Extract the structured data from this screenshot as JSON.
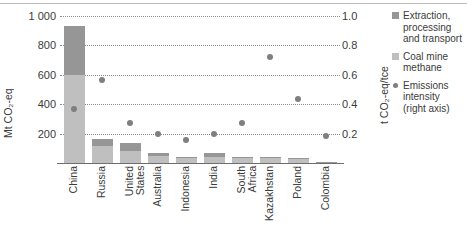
{
  "axes": {
    "left_title": "Mt CO₂-eq",
    "right_title": "t CO₂-eq/tce",
    "left_ticks": [
      "1 000",
      "800",
      "600",
      "400",
      "200"
    ],
    "right_ticks": [
      "1.0",
      "0.8",
      "0.6",
      "0.4",
      "0.2"
    ]
  },
  "legend": {
    "items": [
      {
        "label": "Extraction,\nprocessing\nand transport",
        "marker": "square-swatch",
        "color": "#969696"
      },
      {
        "label": "Coal mine\nmethane",
        "marker": "square-swatch",
        "color": "#bfbfbf"
      },
      {
        "label": "Emissions\nintensity\n(right axis)",
        "marker": "dot-swatch",
        "color": "#7f7f7f"
      }
    ]
  },
  "chart_data": {
    "type": "bar",
    "title": "",
    "xlabel": "",
    "ylabel": "Mt CO₂-eq",
    "y2label": "t CO₂-eq/tce",
    "ylim": [
      0,
      1000
    ],
    "y2lim": [
      0,
      1.0
    ],
    "grid": true,
    "legend_position": "right",
    "categories": [
      "China",
      "Russia",
      "United\nStates",
      "Australia",
      "Indonesia",
      "India",
      "South\nAfrica",
      "Kazakhstan",
      "Poland",
      "Colombia"
    ],
    "series": [
      {
        "name": "Coal mine methane",
        "type": "bar",
        "stack": "emissions",
        "color": "#bfbfbf",
        "unit": "Mt CO2-eq",
        "values": [
          600,
          118,
          82,
          45,
          34,
          38,
          32,
          36,
          28,
          8
        ]
      },
      {
        "name": "Extraction, processing and transport",
        "type": "bar",
        "stack": "emissions",
        "color": "#969696",
        "unit": "Mt CO2-eq",
        "values": [
          335,
          47,
          53,
          25,
          8,
          32,
          8,
          6,
          5,
          2
        ]
      },
      {
        "name": "Emissions intensity (right axis)",
        "type": "scatter",
        "color": "#7f7f7f",
        "unit": "t CO2-eq/tce",
        "axis": "right",
        "values": [
          0.37,
          0.565,
          0.275,
          0.2,
          0.155,
          0.2,
          0.275,
          0.72,
          0.435,
          0.185
        ]
      }
    ],
    "totals": {
      "name": "Total emissions",
      "unit": "Mt CO2-eq",
      "values": [
        935,
        165,
        135,
        70,
        42,
        70,
        40,
        42,
        33,
        10
      ]
    }
  }
}
